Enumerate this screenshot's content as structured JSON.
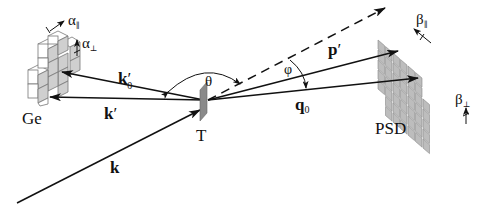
{
  "labels": {
    "ge": "Ge",
    "target": "T",
    "psd": "PSD",
    "k": "k",
    "k_prime": "k",
    "k_prime_mark": "′",
    "k0_prime": "k",
    "k0_prime_mark": "′",
    "k0_sub": "0",
    "p_prime": "p",
    "p_prime_mark": "′",
    "q0": "q",
    "q0_sub": "0",
    "theta": "θ",
    "phi": "φ",
    "alpha_par": "α",
    "alpha_par_sub": "∥",
    "alpha_perp": "α",
    "alpha_perp_sub": "⊥",
    "beta_par": "β",
    "beta_par_sub": "∥",
    "beta_perp": "β",
    "beta_perp_sub": "⊥"
  },
  "colors": {
    "line": "#111111",
    "target": "#8a8a8a",
    "psd_cell": "#bdbdbd",
    "ge_face": "#ffffff",
    "ge_side": "#cfcfcf"
  }
}
